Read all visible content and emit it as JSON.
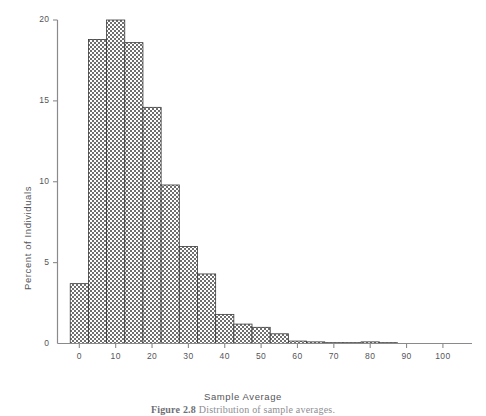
{
  "figure": {
    "caption_number": "Figure 2.8",
    "caption_text": "Distribution of sample averages."
  },
  "chart_data": {
    "type": "bar",
    "title": "",
    "xlabel": "Sample Average",
    "ylabel": "Percent of Individuals",
    "xlim": [
      -6,
      108
    ],
    "ylim": [
      0,
      20
    ],
    "xticks": [
      0,
      10,
      20,
      30,
      40,
      50,
      60,
      70,
      80,
      90,
      100
    ],
    "xtick_labels": [
      "0",
      "10",
      "20",
      "30",
      "40",
      "50",
      "60",
      "70",
      "80",
      "90",
      "100"
    ],
    "yticks": [
      0,
      5,
      10,
      15,
      20
    ],
    "ytick_labels": [
      "0",
      "5",
      "10",
      "15",
      "20"
    ],
    "grid": false,
    "legend": false,
    "bin_width": 5,
    "bin_starts": [
      -2.5,
      2.5,
      7.5,
      12.5,
      17.5,
      22.5,
      27.5,
      32.5,
      37.5,
      42.5,
      47.5,
      52.5,
      57.5,
      62.5,
      67.5,
      72.5,
      77.5,
      82.5
    ],
    "categories": [
      "0",
      "5",
      "10",
      "15",
      "20",
      "25",
      "30",
      "35",
      "40",
      "45",
      "50",
      "55",
      "60",
      "65",
      "70",
      "75",
      "80",
      "85"
    ],
    "values": [
      3.7,
      18.8,
      20.0,
      18.6,
      14.6,
      9.8,
      6.0,
      4.3,
      1.8,
      1.2,
      1.0,
      0.6,
      0.15,
      0.1,
      0.05,
      0.05,
      0.1,
      0.05
    ],
    "bar_fill": "#8c8c8c",
    "bar_edge": "#3a3a3a",
    "bar_pattern": "checkerboard",
    "axis_color": "#8a8a8e"
  }
}
